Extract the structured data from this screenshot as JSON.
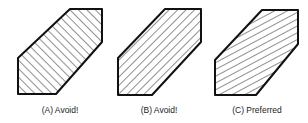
{
  "figure": {
    "panels": [
      {
        "id": "A",
        "caption": "(A) Avoid!",
        "hatch_direction": "up-right 45deg",
        "outline": [
          [
            70,
            9
          ],
          [
            102,
            9
          ],
          [
            102,
            42
          ],
          [
            56,
            94
          ],
          [
            18,
            94
          ],
          [
            18,
            58
          ]
        ],
        "caption_x": 60
      },
      {
        "id": "B",
        "caption": "(B) Avoid!",
        "hatch_direction": "down-right 45deg",
        "outline": [
          [
            165,
            9
          ],
          [
            201,
            9
          ],
          [
            201,
            42
          ],
          [
            152,
            95
          ],
          [
            118,
            95
          ],
          [
            118,
            58
          ]
        ],
        "caption_x": 159
      },
      {
        "id": "C",
        "caption": "(C) Preferred",
        "hatch_direction": "up-right shallow ~28deg",
        "outline": [
          [
            262,
            10
          ],
          [
            298,
            10
          ],
          [
            298,
            44
          ],
          [
            256,
            95
          ],
          [
            215,
            95
          ],
          [
            215,
            60
          ]
        ],
        "caption_x": 257
      }
    ],
    "colors": {
      "outline": "#111111",
      "hatch": "#333333",
      "caption": "#222222",
      "background": "#ffffff"
    }
  }
}
